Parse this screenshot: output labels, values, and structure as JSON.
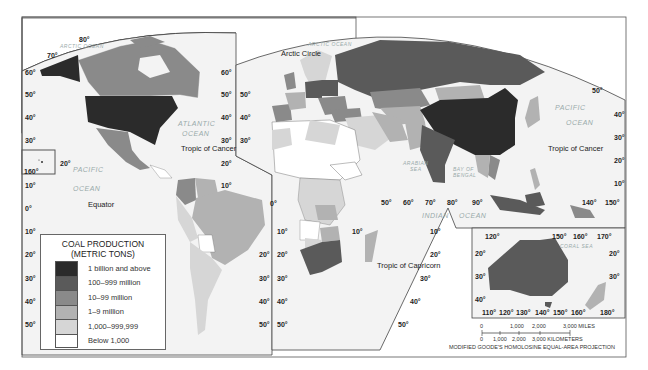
{
  "legend": {
    "title_line1": "COAL PRODUCTION",
    "title_line2": "(METRIC TONS)",
    "items": [
      {
        "label": "1 billion and above",
        "color": "#2b2b2b"
      },
      {
        "label": "100–999 million",
        "color": "#5a5a5a"
      },
      {
        "label": "10–99 million",
        "color": "#8a8a8a"
      },
      {
        "label": "1–9 million",
        "color": "#b2b2b2"
      },
      {
        "label": "1,000–999,999",
        "color": "#d6d6d6"
      },
      {
        "label": "Below 1,000",
        "color": "#ffffff"
      }
    ]
  },
  "labels": {
    "arctic_ocean": "ARCTIC OCEAN",
    "atlantic_ocean_1": "ATLANTIC",
    "atlantic_ocean_2": "OCEAN",
    "pacific_ocean_1": "PACIFIC",
    "pacific_ocean_2": "OCEAN",
    "indian_ocean_1": "INDIAN",
    "indian_ocean_2": "OCEAN",
    "arabian_sea_1": "ARABIAN",
    "arabian_sea_2": "SEA",
    "bay_of_bengal_1": "BAY OF",
    "bay_of_bengal_2": "BENGAL",
    "coral_sea": "CORAL SEA",
    "arctic_circle": "Arctic Circle",
    "tropic_cancer": "Tropic of Cancer",
    "tropic_capricorn": "Tropic of Capricorn",
    "equator": "Equator"
  },
  "degrees": {
    "d0": "0°",
    "d10": "10°",
    "d20": "20°",
    "d30": "30°",
    "d40": "40°",
    "d50": "50°",
    "d60": "60°",
    "d70": "70°",
    "d80": "80°",
    "d90": "90°",
    "d110": "110°",
    "d120": "120°",
    "d130": "130°",
    "d140": "140°",
    "d150": "150°",
    "d160": "160°",
    "d170": "170°",
    "d180": "180°"
  },
  "scale_bar": {
    "miles_ticks": [
      "0",
      "1,000",
      "2,000",
      "3,000 MILES"
    ],
    "km_ticks": [
      "0",
      "1,000",
      "2,000",
      "3,000 KILOMETERS"
    ]
  },
  "projection": "MODIFIED GOODE'S HOMOLOSINE EQUAL-AREA PROJECTION",
  "regions": [
    {
      "name": "United States",
      "class": "1 billion and above"
    },
    {
      "name": "Alaska",
      "class": "1 billion and above"
    },
    {
      "name": "China",
      "class": "1 billion and above"
    },
    {
      "name": "Canada",
      "class": "10–99 million"
    },
    {
      "name": "Mexico",
      "class": "10–99 million"
    },
    {
      "name": "Colombia",
      "class": "10–99 million"
    },
    {
      "name": "Russia",
      "class": "100–999 million"
    },
    {
      "name": "India",
      "class": "100–999 million"
    },
    {
      "name": "Australia",
      "class": "100–999 million"
    },
    {
      "name": "South Africa",
      "class": "100–999 million"
    },
    {
      "name": "Germany",
      "class": "100–999 million"
    },
    {
      "name": "Poland",
      "class": "100–999 million"
    },
    {
      "name": "Kazakhstan",
      "class": "100–999 million"
    },
    {
      "name": "Indonesia",
      "class": "100–999 million"
    },
    {
      "name": "Brazil",
      "class": "1–9 million"
    },
    {
      "name": "Venezuela",
      "class": "1–9 million"
    },
    {
      "name": "Argentina",
      "class": "1,000–999,999"
    },
    {
      "name": "Mongolia",
      "class": "10–99 million"
    },
    {
      "name": "Turkey",
      "class": "10–99 million"
    },
    {
      "name": "Spain",
      "class": "10–99 million"
    },
    {
      "name": "Iran",
      "class": "1–9 million"
    },
    {
      "name": "Zimbabwe",
      "class": "1–9 million"
    },
    {
      "name": "Madagascar",
      "class": "1,000–999,999"
    },
    {
      "name": "Vietnam",
      "class": "10–99 million"
    }
  ]
}
